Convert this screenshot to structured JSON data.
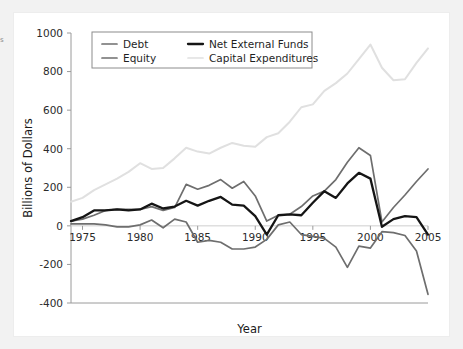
{
  "page": {
    "background_color": "#f2f2f2",
    "panel_color": "#ffffff",
    "edge_artifact_text": "s"
  },
  "chart_data": {
    "type": "line",
    "title": "",
    "subtitle": "",
    "xlabel": "Year",
    "ylabel": "Billions of Dollars",
    "xlim": [
      1974,
      2005
    ],
    "ylim": [
      -400,
      1000
    ],
    "xticks": [
      1975,
      1980,
      1985,
      1990,
      1995,
      2000,
      2005
    ],
    "yticks": [
      -400,
      -200,
      0,
      200,
      400,
      600,
      800,
      1000
    ],
    "xtick_labels": [
      "1975",
      "1980",
      "1985",
      "1990",
      "1995",
      "2000",
      "2005"
    ],
    "ytick_labels": [
      "-400",
      "-200",
      "0",
      "200",
      "400",
      "600",
      "800",
      "1000"
    ],
    "grid": false,
    "legend_position": "upper left",
    "x": [
      1974,
      1975,
      1976,
      1977,
      1978,
      1979,
      1980,
      1981,
      1982,
      1983,
      1984,
      1985,
      1986,
      1987,
      1988,
      1989,
      1990,
      1991,
      1992,
      1993,
      1994,
      1995,
      1996,
      1997,
      1998,
      1999,
      2000,
      2001,
      2002,
      2003,
      2004,
      2005
    ],
    "series": [
      {
        "name": "Debt",
        "color": "#6e6e6e",
        "width": 1.7,
        "values": [
          25,
          35,
          55,
          80,
          85,
          85,
          85,
          100,
          80,
          95,
          215,
          190,
          210,
          240,
          195,
          230,
          155,
          25,
          55,
          60,
          100,
          155,
          180,
          240,
          330,
          405,
          365,
          20,
          95,
          160,
          230,
          295
        ]
      },
      {
        "name": "Equity",
        "color": "#6e6e6e",
        "width": 1.7,
        "values": [
          10,
          10,
          10,
          5,
          -5,
          -5,
          5,
          30,
          -10,
          35,
          20,
          -85,
          -75,
          -85,
          -120,
          -120,
          -110,
          -70,
          5,
          20,
          -45,
          -55,
          -65,
          -110,
          -215,
          -105,
          -115,
          -30,
          -35,
          -50,
          -130,
          -355
        ]
      },
      {
        "name": "Net External Funds",
        "color": "#151515",
        "width": 2.3,
        "values": [
          25,
          45,
          80,
          80,
          85,
          80,
          85,
          115,
          90,
          100,
          130,
          105,
          130,
          150,
          110,
          105,
          50,
          -45,
          55,
          60,
          55,
          120,
          180,
          145,
          220,
          275,
          245,
          -5,
          35,
          50,
          45,
          -45
        ]
      },
      {
        "name": "Capital Expenditures",
        "color": "#e0e0e0",
        "width": 2.0,
        "values": [
          125,
          145,
          185,
          215,
          245,
          280,
          325,
          295,
          300,
          350,
          405,
          385,
          375,
          405,
          430,
          415,
          410,
          460,
          480,
          540,
          615,
          630,
          700,
          740,
          790,
          865,
          940,
          820,
          755,
          760,
          845,
          920
        ]
      }
    ],
    "legend_entries": [
      {
        "label": "Debt",
        "color": "#6e6e6e",
        "row": 0,
        "col": 0
      },
      {
        "label": "Net External Funds",
        "color": "#151515",
        "row": 0,
        "col": 1
      },
      {
        "label": "Equity",
        "color": "#6e6e6e",
        "row": 1,
        "col": 0
      },
      {
        "label": "Capital Expenditures",
        "color": "#e0e0e0",
        "row": 1,
        "col": 1
      }
    ]
  }
}
